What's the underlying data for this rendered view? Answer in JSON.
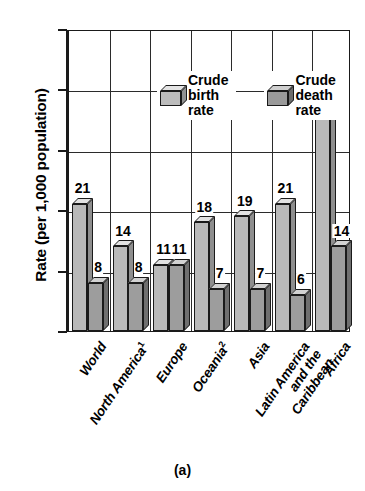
{
  "chart_data": {
    "type": "bar",
    "title": "",
    "xlabel": "",
    "ylabel": "Rate (per 1,000 population)",
    "ylim": [
      0,
      50
    ],
    "yticks": [
      0,
      10,
      20,
      30,
      40,
      50
    ],
    "grid": true,
    "legend_position": "inside-top-left",
    "categories": [
      "World",
      "North America¹",
      "Europe",
      "Oceania²",
      "Asia",
      "Latin America and the Caribbean",
      "Africa"
    ],
    "series": [
      {
        "name": "Crude birth rate",
        "values": [
          21,
          14,
          11,
          18,
          19,
          21,
          37
        ]
      },
      {
        "name": "Crude death rate",
        "values": [
          8,
          8,
          11,
          7,
          7,
          6,
          14
        ]
      }
    ]
  },
  "axis": {
    "y_title": "Rate (per 1,000 population)",
    "y_tick_labels": [
      "0",
      "10",
      "20",
      "30",
      "40",
      "50"
    ]
  },
  "legend": {
    "items": [
      {
        "label": "Crude\nbirth rate",
        "swatch": "light-gray-cube"
      },
      {
        "label": "Crude\ndeath rate",
        "swatch": "dark-gray-cube"
      }
    ]
  },
  "categories": [
    {
      "line1": "World",
      "line2": "",
      "line3": "",
      "sup": ""
    },
    {
      "line1": "North America",
      "line2": "",
      "line3": "",
      "sup": "1"
    },
    {
      "line1": "Europe",
      "line2": "",
      "line3": "",
      "sup": ""
    },
    {
      "line1": "Oceania",
      "line2": "",
      "line3": "",
      "sup": "2"
    },
    {
      "line1": "Asia",
      "line2": "",
      "line3": "",
      "sup": ""
    },
    {
      "line1": "Latin America",
      "line2": "and the",
      "line3": "Caribbean",
      "sup": ""
    },
    {
      "line1": "Africa",
      "line2": "",
      "line3": "",
      "sup": ""
    }
  ],
  "value_labels": {
    "birth": [
      "21",
      "14",
      "11",
      "18",
      "19",
      "21",
      "37"
    ],
    "death": [
      "8",
      "8",
      "11",
      "7",
      "7",
      "6",
      "14"
    ]
  },
  "caption": "(a)",
  "colors": {
    "birth_front": "#b9b9b9",
    "birth_top": "#e2e2e2",
    "birth_side": "#8e8e8e",
    "death_front": "#9d9d9d",
    "death_top": "#d2d2d2",
    "death_side": "#6f6f6f",
    "axis": "#1a1a1a",
    "background": "#ffffff"
  }
}
